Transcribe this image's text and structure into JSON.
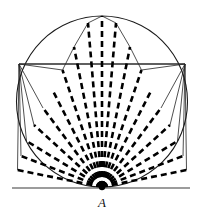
{
  "figure": {
    "type": "geometry-diagram",
    "canvas": {
      "width": 201,
      "height": 224,
      "background": "#ffffff"
    },
    "colors": {
      "stroke": "#1a1a1a",
      "dashed": "#000000",
      "thin": "#222222",
      "tangent": "#3a3a3a",
      "label": "#111111",
      "background": "#ffffff"
    },
    "circle": {
      "name": "main-circle",
      "cx": 102,
      "cy": 101.5,
      "r": 85.5,
      "stroke_width": 1.1,
      "fill": "none"
    },
    "apex_point": {
      "name": "point-A",
      "label": "A",
      "x": 102,
      "y": 187,
      "label_x": 98,
      "label_y": 196,
      "dot_radius": 3.2
    },
    "tangent": {
      "name": "tangent-line",
      "x1": 12,
      "y1": 188,
      "x2": 190,
      "y2": 188,
      "stroke_width": 1.2
    },
    "chord": {
      "name": "horizontal-chord",
      "x1": 19,
      "y1": 64,
      "x2": 185,
      "y2": 64,
      "stroke_width": 1.3
    },
    "dashed_rays": {
      "count": 17,
      "dash_pattern": "6 4",
      "stroke_width": 2.6,
      "angles_deg": [
        -86,
        -76,
        -66.5,
        -57,
        -48,
        -39.5,
        -31,
        -22,
        -11,
        0,
        11,
        22,
        31,
        39.5,
        48,
        57,
        66.5,
        76,
        86
      ],
      "endpoints": [
        {
          "x": 17.5,
          "y": 170.0
        },
        {
          "x": 21.0,
          "y": 156.0
        },
        {
          "x": 26.5,
          "y": 141.0
        },
        {
          "x": 34.0,
          "y": 125.0
        },
        {
          "x": 43.0,
          "y": 108.0
        },
        {
          "x": 52.5,
          "y": 90.0
        },
        {
          "x": 62.5,
          "y": 70.0
        },
        {
          "x": 74.0,
          "y": 47.0
        },
        {
          "x": 88.0,
          "y": 23.0
        },
        {
          "x": 102.0,
          "y": 16.0
        },
        {
          "x": 116.0,
          "y": 23.0
        },
        {
          "x": 130.0,
          "y": 47.0
        },
        {
          "x": 141.5,
          "y": 70.0
        },
        {
          "x": 151.5,
          "y": 90.0
        },
        {
          "x": 161.0,
          "y": 108.0
        },
        {
          "x": 170.0,
          "y": 125.0
        },
        {
          "x": 177.5,
          "y": 141.0
        },
        {
          "x": 183.0,
          "y": 156.0
        },
        {
          "x": 186.5,
          "y": 170.0
        }
      ]
    },
    "thin_rays": {
      "description": "Thin solid segments from the chord endpoints to points on the lower arc",
      "stroke_width": 0.8,
      "left_origin": {
        "x": 19,
        "y": 64
      },
      "right_origin": {
        "x": 185,
        "y": 64
      },
      "left_targets": [
        {
          "x": 17.5,
          "y": 170.0
        },
        {
          "x": 21.0,
          "y": 156.0
        },
        {
          "x": 26.5,
          "y": 141.0
        },
        {
          "x": 34.0,
          "y": 125.0
        },
        {
          "x": 43.0,
          "y": 108.0
        }
      ],
      "right_targets": [
        {
          "x": 186.5,
          "y": 170.0
        },
        {
          "x": 183.0,
          "y": 156.0
        },
        {
          "x": 177.5,
          "y": 141.0
        },
        {
          "x": 170.0,
          "y": 125.0
        },
        {
          "x": 161.0,
          "y": 108.0
        }
      ],
      "upper_left_chords": [
        {
          "x1": 19,
          "y1": 64,
          "x2": 62.5,
          "y2": 70.0
        },
        {
          "x1": 62.5,
          "y1": 70.0,
          "x2": 74.0,
          "y2": 47.0
        },
        {
          "x1": 74.0,
          "y1": 47.0,
          "x2": 88.0,
          "y2": 23.0
        },
        {
          "x1": 88.0,
          "y1": 23.0,
          "x2": 102.0,
          "y2": 16.0
        }
      ],
      "upper_right_chords": [
        {
          "x1": 185,
          "y1": 64,
          "x2": 141.5,
          "y2": 70.0
        },
        {
          "x1": 141.5,
          "y1": 70.0,
          "x2": 130.0,
          "y2": 47.0
        },
        {
          "x1": 130.0,
          "y1": 47.0,
          "x2": 116.0,
          "y2": 23.0
        },
        {
          "x1": 116.0,
          "y1": 23.0,
          "x2": 102.0,
          "y2": 16.0
        }
      ]
    }
  }
}
